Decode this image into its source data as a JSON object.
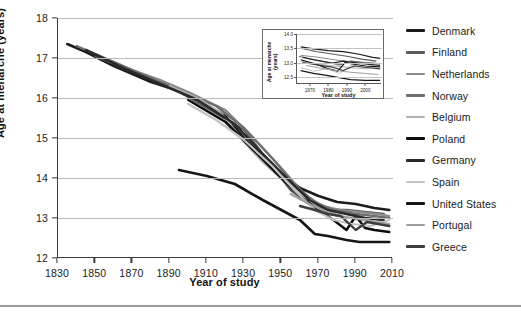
{
  "figure": {
    "background_color": "#ffffff",
    "divider_color": "#9a9a9a"
  },
  "chart_data": {
    "type": "line",
    "title": "",
    "xlabel": "Year of study",
    "ylabel": "Age at menarche (years)",
    "xlim": [
      1830,
      2010
    ],
    "ylim": [
      12,
      18
    ],
    "xticks": [
      1830,
      1850,
      1870,
      1890,
      1910,
      1930,
      1950,
      1970,
      1990,
      2010
    ],
    "yticks": [
      12,
      13,
      14,
      15,
      16,
      17,
      18
    ],
    "grid": "horizontal",
    "legend_position": "right",
    "series": [
      {
        "name": "Denmark",
        "color": "#1c1c1c",
        "width": 2.6,
        "x": [
          1835,
          1845,
          1860,
          1880,
          1900,
          1920,
          1930,
          1945,
          1960,
          1970,
          1980,
          1990,
          2000,
          2008
        ],
        "y": [
          17.35,
          17.15,
          16.8,
          16.4,
          16.1,
          15.55,
          15.0,
          14.3,
          13.75,
          13.55,
          13.4,
          13.35,
          13.25,
          13.2
        ]
      },
      {
        "name": "Finland",
        "color": "#5a5a5a",
        "width": 2.4,
        "x": [
          1850,
          1870,
          1890,
          1910,
          1930,
          1945,
          1955,
          1965,
          1975,
          1985,
          1995,
          2005
        ],
        "y": [
          17.05,
          16.65,
          16.3,
          15.75,
          15.2,
          14.3,
          13.7,
          13.35,
          13.2,
          13.2,
          13.15,
          13.1
        ]
      },
      {
        "name": "Netherlands",
        "color": "#8a8a8a",
        "width": 2.2,
        "x": [
          1850,
          1870,
          1885,
          1900,
          1920,
          1935,
          1950,
          1962,
          1972,
          1982,
          1992,
          2002,
          2008
        ],
        "y": [
          17.1,
          16.7,
          16.45,
          16.15,
          15.7,
          15.0,
          14.25,
          13.6,
          13.3,
          13.2,
          13.15,
          13.1,
          13.05
        ]
      },
      {
        "name": "Norway",
        "color": "#6e6e6e",
        "width": 2.3,
        "x": [
          1840,
          1860,
          1880,
          1900,
          1915,
          1930,
          1945,
          1958,
          1968,
          1978,
          1990,
          2000,
          2008
        ],
        "y": [
          17.3,
          16.9,
          16.5,
          16.1,
          15.8,
          15.25,
          14.5,
          13.8,
          13.4,
          13.2,
          13.1,
          13.05,
          13.0
        ]
      },
      {
        "name": "Belgium",
        "color": "#b0b0b0",
        "width": 2.2,
        "x": [
          1890,
          1905,
          1918,
          1930,
          1940,
          1952,
          1962,
          1972,
          1982,
          1992,
          2000
        ],
        "y": [
          16.3,
          16.0,
          15.6,
          14.9,
          14.4,
          13.9,
          13.45,
          13.2,
          13.05,
          12.95,
          12.9
        ]
      },
      {
        "name": "Poland",
        "color": "#0d0d0d",
        "width": 2.5,
        "x": [
          1900,
          1920,
          1935,
          1950,
          1960,
          1970,
          1978,
          1985,
          1990,
          1995,
          2000,
          2008
        ],
        "y": [
          15.95,
          15.4,
          14.7,
          14.0,
          13.55,
          13.2,
          12.95,
          12.7,
          13.05,
          12.75,
          12.7,
          12.65
        ]
      },
      {
        "name": "Germany",
        "color": "#2a2a2a",
        "width": 2.5,
        "x": [
          1845,
          1865,
          1885,
          1905,
          1925,
          1940,
          1955,
          1965,
          1975,
          1985,
          1995,
          2005
        ],
        "y": [
          17.2,
          16.75,
          16.35,
          15.95,
          15.35,
          14.6,
          13.9,
          13.45,
          13.2,
          13.1,
          13.0,
          12.95
        ]
      },
      {
        "name": "Spain",
        "color": "#c2c2c2",
        "width": 2.2,
        "x": [
          1900,
          1915,
          1930,
          1945,
          1958,
          1968,
          1978,
          1988,
          1998,
          2008
        ],
        "y": [
          15.85,
          15.45,
          14.95,
          14.3,
          13.65,
          13.2,
          12.95,
          12.85,
          12.8,
          12.95
        ]
      },
      {
        "name": "United States",
        "color": "#151515",
        "width": 2.6,
        "x": [
          1895,
          1910,
          1925,
          1940,
          1950,
          1960,
          1968,
          1975,
          1985,
          1992,
          2000,
          2008
        ],
        "y": [
          14.2,
          14.05,
          13.85,
          13.45,
          13.2,
          12.95,
          12.6,
          12.55,
          12.45,
          12.4,
          12.4,
          12.4
        ]
      },
      {
        "name": "Portugal",
        "color": "#9e9e9e",
        "width": 2.2,
        "x": [
          1955,
          1965,
          1972,
          1980,
          1988,
          1995,
          2002,
          2008
        ],
        "y": [
          13.6,
          13.35,
          13.2,
          13.05,
          13.0,
          12.95,
          12.9,
          12.85
        ]
      },
      {
        "name": "Greece",
        "color": "#3d3d3d",
        "width": 2.4,
        "x": [
          1960,
          1968,
          1975,
          1982,
          1990,
          1996,
          2002,
          2008
        ],
        "y": [
          13.3,
          13.2,
          13.1,
          13.05,
          12.7,
          12.9,
          12.85,
          12.8
        ]
      }
    ]
  },
  "inset": {
    "xlabel": "Year of study",
    "ylabel": "Age at menarche (years)",
    "ylabel_line1": "Age at menarche",
    "ylabel_line2": "(years)",
    "xlim": [
      1963,
      2009
    ],
    "ylim": [
      12.25,
      14.0
    ],
    "xticks": [
      1970,
      1980,
      1990,
      2000
    ],
    "yticks": [
      "14.0",
      "13.5",
      "13.0",
      "12.5"
    ],
    "ytick_values": [
      14.0,
      13.5,
      13.0,
      12.5
    ],
    "series": [
      {
        "name": "Denmark",
        "color": "#1c1c1c",
        "width": 1.2,
        "x": [
          1965,
          1972,
          1980,
          1988,
          1996,
          2004,
          2008
        ],
        "y": [
          13.55,
          13.48,
          13.42,
          13.38,
          13.3,
          13.18,
          13.15
        ]
      },
      {
        "name": "Finland",
        "color": "#5a5a5a",
        "width": 1.1,
        "x": [
          1965,
          1974,
          1982,
          1990,
          1998,
          2006
        ],
        "y": [
          13.5,
          13.38,
          13.3,
          13.22,
          13.12,
          13.05
        ]
      },
      {
        "name": "Netherlands",
        "color": "#8a8a8a",
        "width": 1.0,
        "x": [
          1965,
          1973,
          1981,
          1989,
          1997,
          2005
        ],
        "y": [
          13.25,
          13.2,
          13.12,
          13.05,
          13.0,
          12.98
        ]
      },
      {
        "name": "Norway",
        "color": "#6e6e6e",
        "width": 1.1,
        "x": [
          1964,
          1972,
          1980,
          1986,
          1992,
          2000,
          2008
        ],
        "y": [
          13.22,
          13.1,
          13.0,
          12.92,
          13.05,
          13.0,
          12.96
        ]
      },
      {
        "name": "Belgium",
        "color": "#b0b0b0",
        "width": 1.0,
        "x": [
          1965,
          1972,
          1980,
          1988,
          1996,
          2002
        ],
        "y": [
          13.05,
          12.98,
          12.9,
          12.85,
          12.8,
          12.78
        ]
      },
      {
        "name": "Poland",
        "color": "#0d0d0d",
        "width": 1.2,
        "x": [
          1965,
          1973,
          1980,
          1985,
          1989,
          1993,
          2000,
          2008
        ],
        "y": [
          13.1,
          12.95,
          12.78,
          12.7,
          13.0,
          12.95,
          12.88,
          12.85
        ]
      },
      {
        "name": "Germany",
        "color": "#2a2a2a",
        "width": 1.2,
        "x": [
          1966,
          1974,
          1982,
          1988,
          1994,
          2002,
          2008
        ],
        "y": [
          13.18,
          13.08,
          12.98,
          13.05,
          13.0,
          12.94,
          12.9
        ]
      },
      {
        "name": "Spain",
        "color": "#c2c2c2",
        "width": 1.0,
        "x": [
          1965,
          1972,
          1979,
          1986,
          1992,
          1998,
          2006
        ],
        "y": [
          12.82,
          12.7,
          12.78,
          12.62,
          12.9,
          12.85,
          12.8
        ]
      },
      {
        "name": "United States",
        "color": "#151515",
        "width": 1.2,
        "x": [
          1965,
          1972,
          1979,
          1985,
          1992,
          2000,
          2008
        ],
        "y": [
          12.72,
          12.62,
          12.55,
          12.48,
          12.4,
          12.38,
          12.38
        ]
      },
      {
        "name": "Portugal",
        "color": "#9e9e9e",
        "width": 1.0,
        "x": [
          1968,
          1976,
          1984,
          1992,
          2000,
          2007
        ],
        "y": [
          12.9,
          12.8,
          12.72,
          12.66,
          12.62,
          12.58
        ]
      },
      {
        "name": "Greece",
        "color": "#3d3d3d",
        "width": 1.1,
        "x": [
          1966,
          1974,
          1982,
          1988,
          1994,
          2002,
          2008
        ],
        "y": [
          13.0,
          12.92,
          12.84,
          12.72,
          12.88,
          12.82,
          12.78
        ]
      }
    ]
  },
  "legend": {
    "items": [
      {
        "label": "Denmark",
        "color": "#1c1c1c",
        "thickness": 3.2
      },
      {
        "label": "Finland",
        "color": "#5a5a5a",
        "thickness": 2.6
      },
      {
        "label": "Netherlands",
        "color": "#8a8a8a",
        "thickness": 2.4
      },
      {
        "label": "Norway",
        "color": "#6e6e6e",
        "thickness": 2.6
      },
      {
        "label": "Belgium",
        "color": "#b0b0b0",
        "thickness": 2.4
      },
      {
        "label": "Poland",
        "color": "#0d0d0d",
        "thickness": 3.4
      },
      {
        "label": "Germany",
        "color": "#2a2a2a",
        "thickness": 3.2
      },
      {
        "label": "Spain",
        "color": "#c2c2c2",
        "thickness": 2.4
      },
      {
        "label": "United States",
        "color": "#151515",
        "thickness": 3.4
      },
      {
        "label": "Portugal",
        "color": "#9e9e9e",
        "thickness": 2.4
      },
      {
        "label": "Greece",
        "color": "#3d3d3d",
        "thickness": 3.0
      }
    ]
  }
}
